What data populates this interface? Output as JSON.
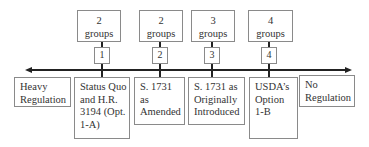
{
  "top_boxes": [
    {
      "count": "2",
      "unit": "groups",
      "number": "1"
    },
    {
      "count": "2",
      "unit": "groups",
      "number": "2"
    },
    {
      "count": "3",
      "unit": "groups",
      "number": "3"
    },
    {
      "count": "4",
      "unit": "groups",
      "number": "4"
    }
  ],
  "bottom_boxes": [
    {
      "lines": [
        "Heavy",
        "Regulation"
      ]
    },
    {
      "lines": [
        "Status Quo",
        "and H.R.",
        "3194 (Opt.",
        "1-A)"
      ]
    },
    {
      "lines": [
        "S. 1731",
        "as",
        "Amended"
      ]
    },
    {
      "lines": [
        "S. 1731 as",
        "Originally",
        "Introduced"
      ]
    },
    {
      "lines": [
        "USDA’s",
        "Option",
        "1-B"
      ]
    },
    {
      "lines": [
        "No",
        "Regulation"
      ]
    }
  ],
  "axis": {
    "direction": "bidirectional",
    "left_end": "Heavy Regulation",
    "right_end": "No Regulation"
  }
}
